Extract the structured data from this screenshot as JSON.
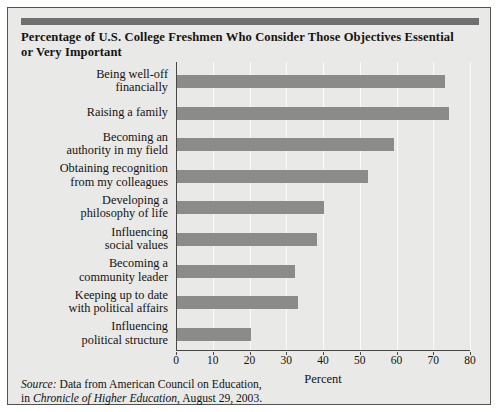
{
  "figure": {
    "title": "Percentage of U.S. College Freshmen Who Consider Those Objectives Essential or Very Important",
    "source_prefix": "Source:",
    "source_line1": " Data from American Council on Education,",
    "source_line2_lead": "in ",
    "source_line2_italic": "Chronicle of Higher Education",
    "source_line2_tail": ", August 29, 2003."
  },
  "chart_data": {
    "type": "bar",
    "orientation": "horizontal",
    "title": "Percentage of U.S. College Freshmen Who Consider Those Objectives Essential or Very Important",
    "xlabel": "Percent",
    "ylabel": "",
    "xlim": [
      0,
      80
    ],
    "xticks": [
      0,
      10,
      20,
      30,
      40,
      50,
      60,
      70,
      80
    ],
    "xticklabels": [
      "0",
      "10",
      "20",
      "30",
      "40",
      "50",
      "60",
      "70",
      "80"
    ],
    "grid": "vertical",
    "legend": "none",
    "bar_color": "#8b8b8b",
    "categories": [
      "Being well-off financially",
      "Raising a family",
      "Becoming an authority in my field",
      "Obtaining recognition from my colleagues",
      "Developing a philosophy of life",
      "Influencing social values",
      "Becoming a community leader",
      "Keeping up to date with political affairs",
      "Influencing political structure"
    ],
    "category_lines": [
      [
        "Being well-off",
        "financially"
      ],
      [
        "Raising a family"
      ],
      [
        "Becoming an",
        "authority in my field"
      ],
      [
        "Obtaining recognition",
        "from my colleagues"
      ],
      [
        "Developing a",
        "philosophy of life"
      ],
      [
        "Influencing",
        "social values"
      ],
      [
        "Becoming a",
        "community leader"
      ],
      [
        "Keeping up to date",
        "with political affairs"
      ],
      [
        "Influencing",
        "political structure"
      ]
    ],
    "values": [
      73,
      74,
      59,
      52,
      40,
      38,
      32,
      33,
      20
    ]
  }
}
